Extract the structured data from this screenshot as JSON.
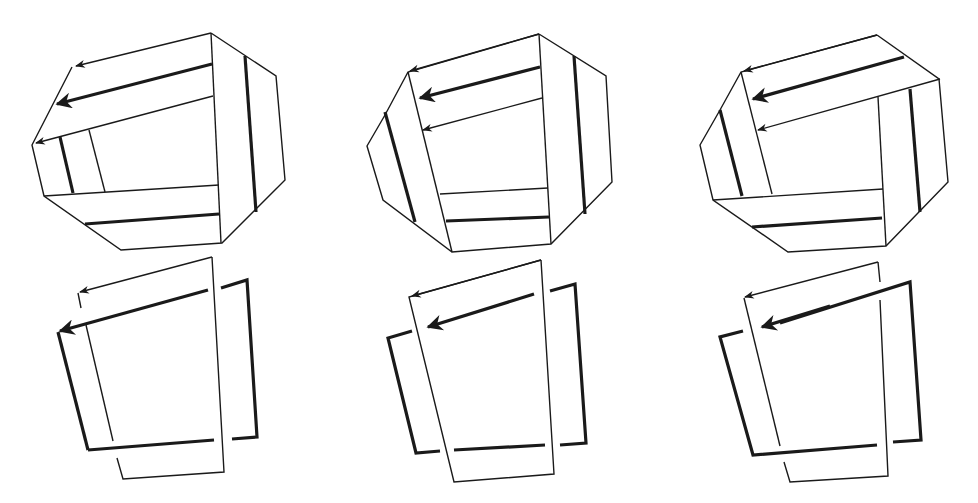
{
  "figure": {
    "colors": {
      "stroke": "#1a1a1a",
      "background": "#ffffff"
    },
    "panels": [
      {
        "id": "top-1",
        "row": "top",
        "column": 1,
        "type": "folded-octagon-band"
      },
      {
        "id": "top-2",
        "row": "top",
        "column": 2,
        "type": "folded-octagon-band"
      },
      {
        "id": "top-3",
        "row": "top",
        "column": 3,
        "type": "folded-octagon-band"
      },
      {
        "id": "bottom-1",
        "row": "bottom",
        "column": 1,
        "type": "interlinked-loops"
      },
      {
        "id": "bottom-2",
        "row": "bottom",
        "column": 2,
        "type": "interlinked-loops"
      },
      {
        "id": "bottom-3",
        "row": "bottom",
        "column": 3,
        "type": "interlinked-loops"
      }
    ]
  }
}
